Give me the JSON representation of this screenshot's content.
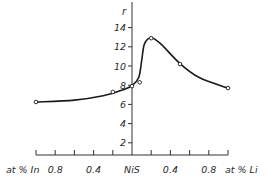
{
  "chart_data": {
    "type": "line",
    "title": "",
    "xlabel_left": "at % In",
    "xlabel_center": "NiS",
    "xlabel_right": "at % Li",
    "ylabel": "r",
    "x_description": "Signed composition: negative = at % In, positive = at % Li, 0 = NiS",
    "xlim": [
      -1.0,
      1.0
    ],
    "ylim": [
      0,
      15
    ],
    "x_ticks": [
      -1.0,
      -0.8,
      -0.6,
      -0.4,
      -0.2,
      0,
      0.2,
      0.4,
      0.6,
      0.8,
      1.0
    ],
    "x_tick_labels": [
      {
        "value": -0.8,
        "label": "0.8"
      },
      {
        "value": -0.4,
        "label": "0.4"
      },
      {
        "value": 0.4,
        "label": "0.4"
      },
      {
        "value": 0.8,
        "label": "0.8"
      }
    ],
    "y_ticks": [
      2,
      4,
      6,
      8,
      10,
      12,
      14
    ],
    "y_tick_labels": [
      "2",
      "4",
      "6",
      "8",
      "10",
      "12",
      "14"
    ],
    "grid": false,
    "legend": "none",
    "series": [
      {
        "name": "measured",
        "marker": "open-circle",
        "points": [
          {
            "x": -1.0,
            "y": 6.25
          },
          {
            "x": -0.2,
            "y": 7.3
          },
          {
            "x": 0.0,
            "y": 7.9
          },
          {
            "x": 0.08,
            "y": 8.3
          },
          {
            "x": 0.2,
            "y": 12.9
          },
          {
            "x": 0.5,
            "y": 10.2
          },
          {
            "x": 1.0,
            "y": 7.7
          }
        ]
      },
      {
        "name": "fitted-curve",
        "marker": "none",
        "points": [
          {
            "x": -1.0,
            "y": 6.25
          },
          {
            "x": -0.6,
            "y": 6.45
          },
          {
            "x": -0.3,
            "y": 6.9
          },
          {
            "x": -0.1,
            "y": 7.5
          },
          {
            "x": 0.0,
            "y": 7.95
          },
          {
            "x": 0.07,
            "y": 8.8
          },
          {
            "x": 0.1,
            "y": 10.5
          },
          {
            "x": 0.13,
            "y": 12.3
          },
          {
            "x": 0.2,
            "y": 12.95
          },
          {
            "x": 0.3,
            "y": 12.3
          },
          {
            "x": 0.5,
            "y": 10.25
          },
          {
            "x": 0.7,
            "y": 8.8
          },
          {
            "x": 1.0,
            "y": 7.7
          }
        ]
      }
    ]
  }
}
